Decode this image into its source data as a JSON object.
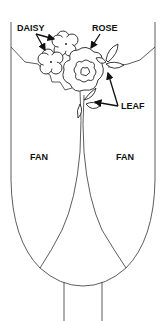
{
  "diagram": {
    "labels": {
      "daisy": "DAISY",
      "rose": "ROSE",
      "leaf": "LEAF",
      "fan_left": "FAN",
      "fan_right": "FAN"
    },
    "colors": {
      "line": "#333333",
      "text": "#111111",
      "background": "#ffffff"
    }
  }
}
